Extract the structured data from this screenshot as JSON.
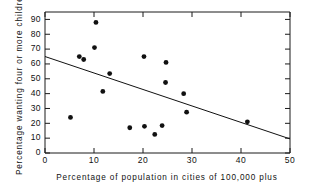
{
  "chart_data": {
    "type": "scatter",
    "title": "",
    "xlabel": "Percentage of population in cities of 100,000 plus",
    "ylabel": "Percentage wanting four or more children",
    "xlim": [
      0,
      50
    ],
    "ylim": [
      0,
      95
    ],
    "xticks": [
      0,
      10,
      20,
      30,
      40,
      50
    ],
    "xtick_labels": [
      "0",
      "10",
      "20",
      "30",
      "40",
      "50"
    ],
    "yticks": [
      0,
      10,
      20,
      30,
      40,
      50,
      60,
      70,
      80,
      90
    ],
    "ytick_labels": [
      "0",
      "10",
      "20",
      "30",
      "40",
      "50",
      "60",
      "70",
      "80",
      "90"
    ],
    "grid": false,
    "legend": "none",
    "marker": "filled-circle",
    "marker_color": "#111111",
    "points": [
      {
        "x": 5.2,
        "y": 24.0
      },
      {
        "x": 7.0,
        "y": 65.0
      },
      {
        "x": 7.9,
        "y": 63.0
      },
      {
        "x": 10.4,
        "y": 88.0
      },
      {
        "x": 10.1,
        "y": 71.0
      },
      {
        "x": 11.8,
        "y": 41.5
      },
      {
        "x": 13.2,
        "y": 53.5
      },
      {
        "x": 17.3,
        "y": 17.0
      },
      {
        "x": 20.3,
        "y": 18.0
      },
      {
        "x": 20.2,
        "y": 65.0
      },
      {
        "x": 22.4,
        "y": 12.5
      },
      {
        "x": 23.9,
        "y": 18.5
      },
      {
        "x": 24.7,
        "y": 61.0
      },
      {
        "x": 24.6,
        "y": 47.5
      },
      {
        "x": 28.3,
        "y": 40.0
      },
      {
        "x": 28.9,
        "y": 27.5
      },
      {
        "x": 41.3,
        "y": 21.0
      }
    ],
    "trend_line": {
      "label": "regression-line",
      "color": "#111111",
      "x_start": 0,
      "y_start": 65.0,
      "x_end": 50.5,
      "y_end": 9.5
    }
  }
}
